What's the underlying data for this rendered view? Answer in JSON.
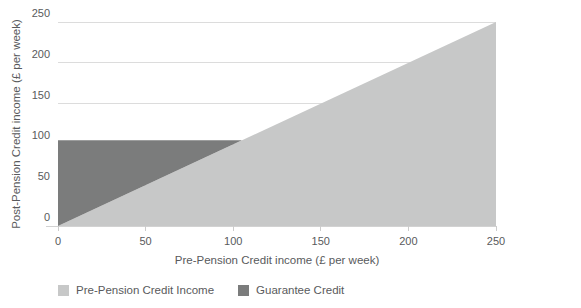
{
  "chart_data": {
    "type": "area",
    "title": "",
    "xlabel": "Pre-Pension Credit income (£ per week)",
    "ylabel": "Post-Pension Credit income (£ per week)",
    "xlim": [
      0,
      250
    ],
    "ylim": [
      0,
      250
    ],
    "xticks": [
      0,
      50,
      100,
      150,
      200,
      250
    ],
    "yticks": [
      0,
      50,
      100,
      150,
      200,
      250
    ],
    "grid": "horizontal-only",
    "legend_position": "bottom-left",
    "guarantee_credit_level": 105,
    "series": [
      {
        "name": "Pre-Pension Credit Income",
        "color": "#c7c8c8",
        "polygon": [
          [
            0,
            0
          ],
          [
            250,
            250
          ],
          [
            250,
            0
          ]
        ]
      },
      {
        "name": "Guarantee Credit",
        "color": "#7b7c7c",
        "polygon": [
          [
            0,
            0
          ],
          [
            0,
            105
          ],
          [
            105,
            105
          ]
        ]
      }
    ]
  },
  "legend": {
    "items": [
      {
        "label": "Pre-Pension Credit Income",
        "color": "#c7c8c8"
      },
      {
        "label": "Guarantee Credit",
        "color": "#7b7c7c"
      }
    ]
  },
  "style": {
    "background": "#ffffff",
    "grid_color": "#dcdcdc",
    "axis_line_color": "#d2d2d2",
    "tick_color": "#cccccc",
    "text_color": "#595a5c"
  }
}
